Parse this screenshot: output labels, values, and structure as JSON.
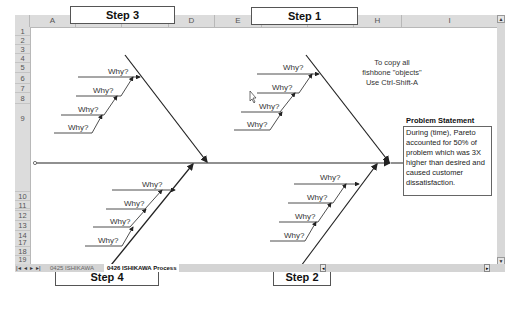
{
  "spreadsheet": {
    "columns": [
      "A",
      "B",
      "C",
      "D",
      "E",
      "F",
      "G",
      "H",
      "I"
    ],
    "rows": [
      "1",
      "2",
      "3",
      "4",
      "5",
      "6",
      "7",
      "8",
      "9",
      "10",
      "11",
      "12",
      "13",
      "14",
      "15",
      "16",
      "17",
      "18",
      "19"
    ],
    "tabs": [
      {
        "label": "0425 ISHIKAWA",
        "active": false
      },
      {
        "label": "0426 ISHIKAWA Process",
        "active": true
      }
    ]
  },
  "diagram": {
    "steps": {
      "step1": "Step 1",
      "step2": "Step 2",
      "step3": "Step 3",
      "step4": "Step 4"
    },
    "why_label": "Why?",
    "note": {
      "line1": "To copy all",
      "line2": "fishbone \"objects\"",
      "line3": "Use Ctrl-Shift-A"
    },
    "problem_statement": {
      "title": "Problem Statement",
      "text": "During (time), Pareto accounted for 50% of problem which was 3X higher than desired and caused customer dissatisfaction."
    }
  },
  "colors": {
    "header_bg": "#dcdcdc",
    "line": "#222222",
    "box_border": "#555555"
  }
}
